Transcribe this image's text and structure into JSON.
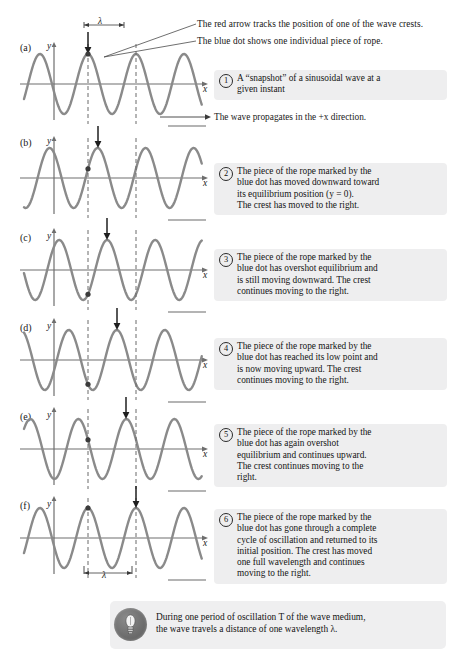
{
  "figure": {
    "panel_labels": [
      "(a)",
      "(b)",
      "(c)",
      "(d)",
      "(e)",
      "(f)"
    ],
    "axis_y_label": "y",
    "axis_x_label": "x",
    "wavelength_symbol": "λ"
  },
  "colors": {
    "wave": "#8a8a8a",
    "axis": "#6e6e6e",
    "arrow": "#1f1f1f",
    "dashed": "#6b6b6b",
    "callout_bg": "#eeeeef",
    "tip_bg": "#efeff0",
    "text": "#141414"
  },
  "leaders": [
    {
      "name": "red-arrow-note",
      "text": "The red arrow tracks the position of one of the wave crests."
    },
    {
      "name": "blue-dot-note",
      "text": "The blue dot shows one individual piece of rope."
    }
  ],
  "propagation_note": "The wave propagates in the +x direction.",
  "callouts": [
    {
      "number": "1",
      "lines": [
        "A “snapshot” of a sinusoidal wave at a",
        "given instant"
      ]
    },
    {
      "number": "2",
      "lines": [
        "The piece of the rope marked by the",
        "blue dot has moved downward toward",
        "its equilibrium position (y = 0).",
        "The crest has moved to the right."
      ]
    },
    {
      "number": "3",
      "lines": [
        "The piece of the rope marked by the",
        "blue dot has overshot equilibrium and",
        "is still moving downward. The crest",
        "continues moving to the right."
      ]
    },
    {
      "number": "4",
      "lines": [
        "The piece of the rope marked by the",
        "blue dot has reached its low point and",
        "is now moving upward. The crest",
        "continues moving to the right."
      ]
    },
    {
      "number": "5",
      "lines": [
        "The piece of the rope marked by the",
        "blue dot has again overshot",
        "equilibrium and continues upward.",
        "The crest continues moving to the",
        "right."
      ]
    },
    {
      "number": "6",
      "lines": [
        "The piece of the rope marked by the",
        "blue dot has gone through a complete",
        "cycle of oscillation and returned to its",
        "initial position. The crest has moved",
        "one full wavelength and continues",
        "moving to the right."
      ]
    }
  ],
  "tip": {
    "icon": "lightbulb-icon",
    "lines": [
      "During one period of oscillation T of the wave medium,",
      "the wave travels a distance of one wavelength λ."
    ]
  },
  "chart_data": {
    "type": "line",
    "xlabel": "x",
    "ylabel": "y",
    "grid": false,
    "legend": "none",
    "wavelength_px": 48,
    "amplitude_px": 30,
    "phase_shift_per_panel_fraction": 0.2,
    "panels": [
      {
        "label": "(a)",
        "phase_fraction": 0.0,
        "arrow_x_px": 88,
        "crest_phase": "crest at marker",
        "dot_state": "at crest"
      },
      {
        "label": "(b)",
        "phase_fraction": 0.2,
        "arrow_x_px": 98,
        "crest_phase": "crest moved right",
        "dot_state": "moving downward toward equilibrium"
      },
      {
        "label": "(c)",
        "phase_fraction": 0.4,
        "arrow_x_px": 107,
        "crest_phase": "crest moved right",
        "dot_state": "below equilibrium, moving downward"
      },
      {
        "label": "(d)",
        "phase_fraction": 0.6,
        "arrow_x_px": 117,
        "crest_phase": "crest moved right",
        "dot_state": "at low point, now moving upward"
      },
      {
        "label": "(e)",
        "phase_fraction": 0.8,
        "arrow_x_px": 126,
        "crest_phase": "crest moved right",
        "dot_state": "above equilibrium, moving upward"
      },
      {
        "label": "(f)",
        "phase_fraction": 1.0,
        "arrow_x_px": 136,
        "crest_phase": "crest moved one full wavelength",
        "dot_state": "back at initial position"
      }
    ],
    "dashed_marker_x_px": [
      88,
      136
    ],
    "x_axis_range_px": [
      30,
      200
    ]
  }
}
